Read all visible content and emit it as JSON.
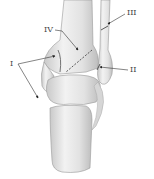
{
  "figure": {
    "labels": [
      {
        "id": "I",
        "text": "I",
        "x": 10,
        "y": 62
      },
      {
        "id": "II",
        "text": "II",
        "x": 130,
        "y": 66
      },
      {
        "id": "III",
        "text": "III",
        "x": 127,
        "y": 10
      },
      {
        "id": "IV",
        "text": "IV",
        "x": 45,
        "y": 26
      }
    ],
    "colors": {
      "bone": "#e6e6e6",
      "bone_shadow": "#b5b5b5",
      "outline": "#8a8a8a",
      "leader": "#333333"
    }
  }
}
